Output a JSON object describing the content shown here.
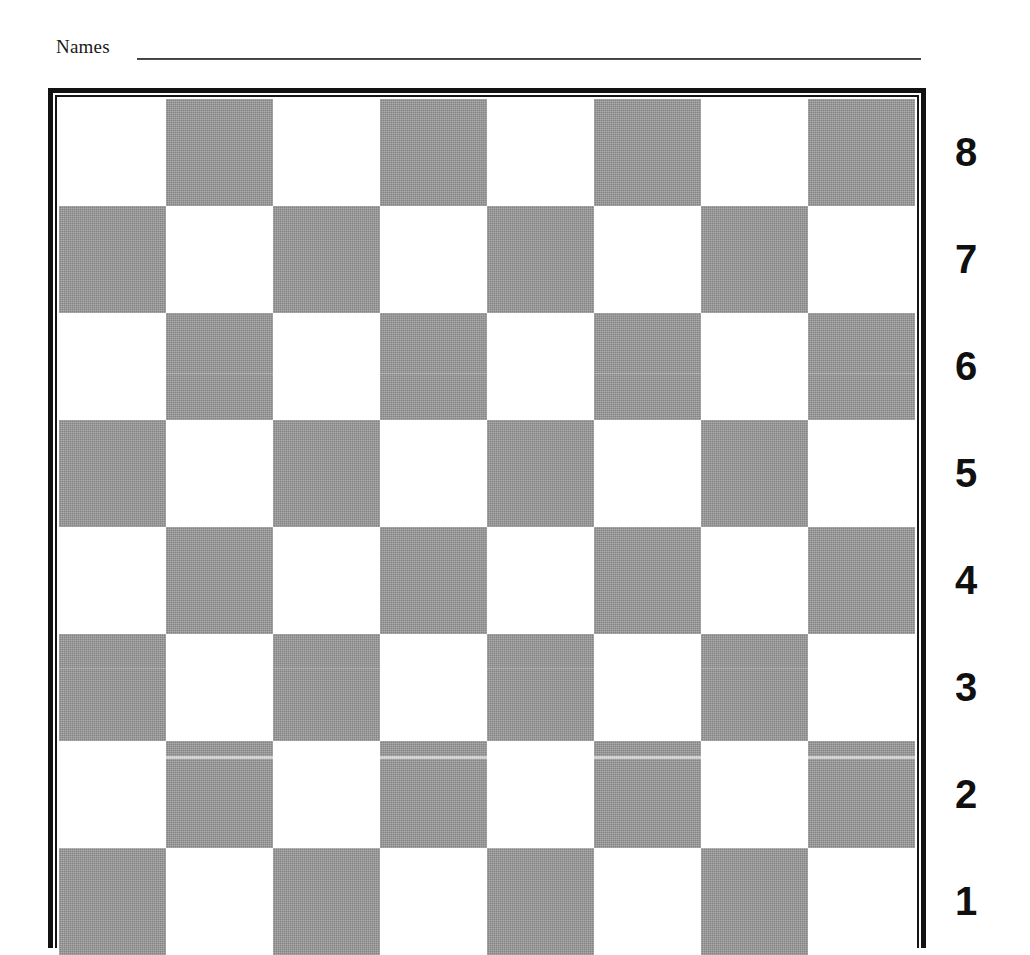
{
  "page": {
    "background_color": "#ffffff",
    "title_field": {
      "label": "Names",
      "rule_color": "#2a2c2e"
    }
  },
  "board": {
    "kind": "chessboard-diagram",
    "files": 8,
    "ranks": 8,
    "light_square_color": "#ffffff",
    "dark_square_color": "#9a9a9a",
    "border_color": "#121212",
    "top_left_square_shade": "light",
    "rank_labels": [
      "8",
      "7",
      "6",
      "5",
      "4",
      "3",
      "2",
      "1"
    ],
    "squares": [
      [
        "light",
        "dark",
        "light",
        "dark",
        "light",
        "dark",
        "light",
        "dark"
      ],
      [
        "dark",
        "light",
        "dark",
        "light",
        "dark",
        "light",
        "dark",
        "light"
      ],
      [
        "light",
        "dark",
        "light",
        "dark",
        "light",
        "dark",
        "light",
        "dark"
      ],
      [
        "dark",
        "light",
        "dark",
        "light",
        "dark",
        "light",
        "dark",
        "light"
      ],
      [
        "light",
        "dark",
        "light",
        "dark",
        "light",
        "dark",
        "light",
        "dark"
      ],
      [
        "dark",
        "light",
        "dark",
        "light",
        "dark",
        "light",
        "dark",
        "light"
      ],
      [
        "light",
        "dark",
        "light",
        "dark",
        "light",
        "dark",
        "light",
        "dark"
      ],
      [
        "dark",
        "light",
        "dark",
        "light",
        "dark",
        "light",
        "dark",
        "light"
      ]
    ]
  }
}
